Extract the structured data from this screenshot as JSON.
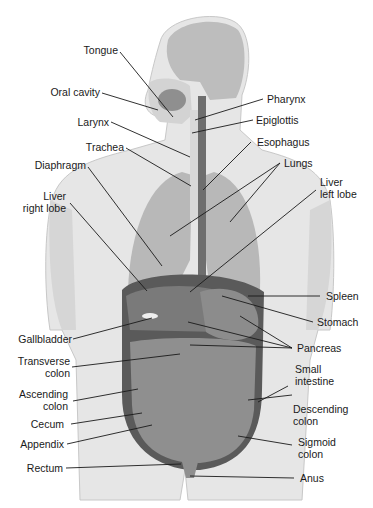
{
  "diagram": {
    "labels_left": [
      {
        "id": "tongue",
        "text": "Tongue"
      },
      {
        "id": "oral-cavity",
        "text": "Oral cavity"
      },
      {
        "id": "larynx",
        "text": "Larynx"
      },
      {
        "id": "trachea",
        "text": "Trachea"
      },
      {
        "id": "diaphragm",
        "text": "Diaphragm"
      },
      {
        "id": "liver-right-lobe",
        "text": "Liver",
        "text2": "right lobe"
      },
      {
        "id": "gallbladder",
        "text": "Gallbladder"
      },
      {
        "id": "transverse-colon",
        "text": "Transverse",
        "text2": "colon"
      },
      {
        "id": "ascending-colon",
        "text": "Ascending",
        "text2": "colon"
      },
      {
        "id": "cecum",
        "text": "Cecum"
      },
      {
        "id": "appendix",
        "text": "Appendix"
      },
      {
        "id": "rectum",
        "text": "Rectum"
      }
    ],
    "labels_right": [
      {
        "id": "pharynx",
        "text": "Pharynx"
      },
      {
        "id": "epiglottis",
        "text": "Epiglottis"
      },
      {
        "id": "esophagus",
        "text": "Esophagus"
      },
      {
        "id": "lungs",
        "text": "Lungs"
      },
      {
        "id": "liver-left-lobe",
        "text": "Liver",
        "text2": "left lobe"
      },
      {
        "id": "spleen",
        "text": "Spleen"
      },
      {
        "id": "stomach",
        "text": "Stomach"
      },
      {
        "id": "pancreas",
        "text": "Pancreas"
      },
      {
        "id": "small-intestine",
        "text": "Small",
        "text2": "intestine"
      },
      {
        "id": "descending-colon",
        "text": "Descending",
        "text2": "colon"
      },
      {
        "id": "sigmoid-colon",
        "text": "Sigmoid",
        "text2": "colon"
      },
      {
        "id": "anus",
        "text": "Anus"
      }
    ],
    "colors": {
      "background": "#ffffff",
      "body_skin": "#e6e6e6",
      "body_shadow": "#cfcfcf",
      "lungs": "#b8b8b8",
      "liver": "#7a7a7a",
      "stomach": "#8c8c8c",
      "intestine": "#8f8f8f",
      "colon_border": "#5a5a5a",
      "esophagus": "#6e6e6e",
      "leader_line": "#1a1a1a",
      "label_text": "#1a1a1a"
    }
  }
}
